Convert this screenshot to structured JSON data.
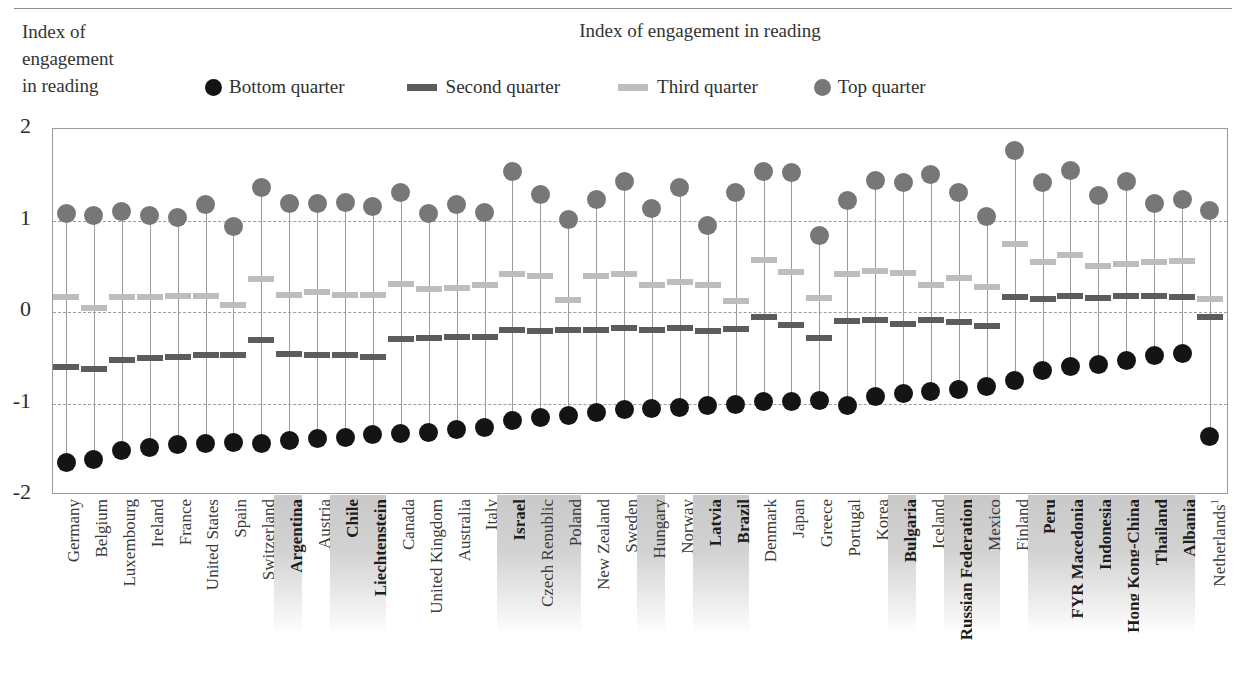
{
  "axis_caption": [
    "Index of",
    "engagement",
    "in reading"
  ],
  "chart_title": "Index of engagement in reading",
  "legend": [
    {
      "label": "Bottom quarter",
      "marker": "circle",
      "color": "#141414",
      "name": "legend-bottom-quarter"
    },
    {
      "label": "Second quarter",
      "marker": "dash",
      "color": "#5c5c5c",
      "name": "legend-second-quarter"
    },
    {
      "label": "Third quarter",
      "marker": "dash",
      "color": "#bdbdbd",
      "name": "legend-third-quarter"
    },
    {
      "label": "Top quarter",
      "marker": "circle",
      "color": "#777777",
      "name": "legend-top-quarter"
    }
  ],
  "colors": {
    "bottom_quarter": "#141414",
    "second_quarter": "#5c5c5c",
    "third_quarter": "#bdbdbd",
    "top_quarter": "#777777",
    "stem": "#9b9b9b",
    "gridline": "#9d9d9d",
    "frame": "#9a9a9a",
    "highlight_band": "#c9c9c9"
  },
  "chart_data": {
    "type": "scatter",
    "title": "Index of engagement in reading",
    "xlabel": "",
    "ylabel": "Index of engagement in reading",
    "ylim": [
      -2,
      2
    ],
    "yticks": [
      2,
      1,
      0,
      -1,
      -2
    ],
    "ytick_labels": [
      "2",
      "1",
      "0",
      "-1",
      "-2"
    ],
    "grid": true,
    "legend_position": "top",
    "series": [
      {
        "name": "Bottom quarter",
        "marker": "circle",
        "color": "#141414"
      },
      {
        "name": "Second quarter",
        "marker": "dash",
        "color": "#5c5c5c"
      },
      {
        "name": "Third quarter",
        "marker": "dash",
        "color": "#bdbdbd"
      },
      {
        "name": "Top quarter",
        "marker": "circle",
        "color": "#777777"
      }
    ],
    "categories": [
      "Germany",
      "Belgium",
      "Luxembourg",
      "Ireland",
      "France",
      "United States",
      "Spain",
      "Switzerland",
      "Argentina",
      "Austria",
      "Chile",
      "Liechtenstein",
      "Canada",
      "United Kingdom",
      "Australia",
      "Italy",
      "Israel",
      "Czech Republic",
      "Poland",
      "New Zealand",
      "Sweden",
      "Hungary",
      "Norway",
      "Latvia",
      "Brazil",
      "Denmark",
      "Japan",
      "Greece",
      "Portugal",
      "Korea",
      "Bulgaria",
      "Iceland",
      "Russian Federation",
      "Mexico",
      "Finland",
      "Peru",
      "FYR Macedonia",
      "Indonesia",
      "Hong Kong-China",
      "Thailand",
      "Albania",
      "Netherlands"
    ],
    "category_highlight": [
      false,
      false,
      false,
      false,
      false,
      false,
      false,
      false,
      true,
      false,
      true,
      true,
      false,
      false,
      false,
      false,
      true,
      true,
      true,
      false,
      false,
      true,
      false,
      true,
      true,
      false,
      false,
      false,
      false,
      false,
      true,
      false,
      true,
      true,
      false,
      true,
      true,
      true,
      true,
      true,
      true,
      false
    ],
    "category_bold": [
      false,
      false,
      false,
      false,
      false,
      false,
      false,
      false,
      true,
      false,
      true,
      true,
      false,
      false,
      false,
      false,
      true,
      false,
      false,
      false,
      false,
      false,
      false,
      true,
      true,
      false,
      false,
      false,
      false,
      false,
      true,
      false,
      true,
      false,
      false,
      true,
      true,
      true,
      true,
      true,
      true,
      false
    ],
    "category_superscript": {
      "Netherlands": "1"
    },
    "values": {
      "bottom_quarter": [
        -1.65,
        -1.61,
        -1.51,
        -1.48,
        -1.45,
        -1.44,
        -1.43,
        -1.44,
        -1.4,
        -1.38,
        -1.37,
        -1.34,
        -1.33,
        -1.32,
        -1.28,
        -1.26,
        -1.19,
        -1.15,
        -1.13,
        -1.1,
        -1.07,
        -1.06,
        -1.04,
        -1.02,
        -1.01,
        -0.98,
        -0.98,
        -0.97,
        -1.02,
        -0.92,
        -0.89,
        -0.87,
        -0.85,
        -0.81,
        -0.75,
        -0.64,
        -0.6,
        -0.57,
        -0.53,
        -0.48,
        -0.45,
        -1.36
      ],
      "second_quarter": [
        -0.6,
        -0.62,
        -0.52,
        -0.5,
        -0.49,
        -0.47,
        -0.47,
        -0.31,
        -0.46,
        -0.47,
        -0.47,
        -0.49,
        -0.3,
        -0.28,
        -0.27,
        -0.27,
        -0.2,
        -0.21,
        -0.2,
        -0.2,
        -0.18,
        -0.2,
        -0.18,
        -0.21,
        -0.19,
        -0.05,
        -0.14,
        -0.28,
        -0.1,
        -0.09,
        -0.13,
        -0.09,
        -0.11,
        -0.15,
        0.16,
        0.14,
        0.17,
        0.15,
        0.17,
        0.17,
        0.16,
        -0.06
      ],
      "third_quarter": [
        0.16,
        0.04,
        0.16,
        0.16,
        0.17,
        0.17,
        0.08,
        0.36,
        0.19,
        0.22,
        0.19,
        0.19,
        0.31,
        0.25,
        0.26,
        0.3,
        0.42,
        0.39,
        0.13,
        0.39,
        0.42,
        0.3,
        0.33,
        0.29,
        0.12,
        0.57,
        0.44,
        0.15,
        0.41,
        0.45,
        0.43,
        0.3,
        0.37,
        0.27,
        0.74,
        0.55,
        0.62,
        0.5,
        0.52,
        0.55,
        0.56,
        0.14
      ],
      "top_quarter": [
        1.08,
        1.05,
        1.1,
        1.05,
        1.03,
        1.18,
        0.93,
        1.36,
        1.19,
        1.19,
        1.2,
        1.15,
        1.31,
        1.08,
        1.18,
        1.09,
        1.54,
        1.28,
        1.01,
        1.23,
        1.43,
        1.13,
        1.36,
        0.94,
        1.31,
        1.54,
        1.53,
        0.84,
        1.22,
        1.44,
        1.42,
        1.5,
        1.31,
        1.04,
        1.76,
        1.41,
        1.55,
        1.27,
        1.43,
        1.19,
        1.23,
        1.11
      ]
    }
  }
}
